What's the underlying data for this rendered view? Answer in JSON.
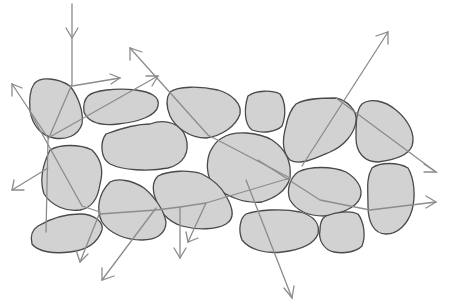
{
  "diagram": {
    "title": "",
    "colors": {
      "grain_fill": "#d2d2d2",
      "grain_stroke": "#4a4a4a",
      "ray": "#8c8c8c",
      "background": "#ffffff"
    },
    "grains": [
      {
        "id": "g1",
        "d": "M34,84 C40,76 58,78 70,86 C78,96 84,112 82,124 C78,136 66,140 54,138 C42,136 32,126 30,110 C29,98 30,90 34,84 Z"
      },
      {
        "id": "g2",
        "d": "M88,96 C94,90 116,88 136,90 C150,92 160,96 158,106 C156,116 138,122 118,124 C100,126 88,122 84,112 C83,104 85,99 88,96 Z"
      },
      {
        "id": "g3",
        "d": "M106,134 C122,128 140,124 150,124 C166,118 182,124 186,138 C190,152 184,164 168,168 C148,172 122,170 110,164 C100,158 100,142 106,134 Z"
      },
      {
        "id": "g4",
        "d": "M170,92 C178,86 200,86 218,90 C232,94 242,104 240,114 C236,126 222,136 206,138 C190,138 176,128 170,116 C166,106 166,98 170,92 Z"
      },
      {
        "id": "g5",
        "d": "M248,96 C256,90 272,90 280,94 C286,102 286,116 282,126 C276,132 262,134 252,130 C244,124 244,108 248,96 Z"
      },
      {
        "id": "g6",
        "d": "M296,104 C306,98 324,98 336,98 C346,100 358,110 356,122 C354,134 344,146 330,152 C316,158 300,166 290,160 C282,152 282,140 286,126 C288,116 292,108 296,104 Z"
      },
      {
        "id": "g7",
        "d": "M362,104 C370,98 384,100 396,110 C408,120 416,134 412,146 C408,156 394,160 378,162 C364,162 356,152 356,138 C356,124 356,110 362,104 Z"
      },
      {
        "id": "g8",
        "d": "M222,138 C234,130 258,132 272,140 C284,148 292,160 290,178 C286,192 274,198 262,202 C244,204 226,196 214,186 C206,176 206,162 210,152 C214,144 218,140 222,138 Z"
      },
      {
        "id": "g9",
        "d": "M50,150 C60,144 80,144 92,150 C100,158 104,170 100,184 C98,198 92,208 80,210 C66,212 52,206 44,194 C40,182 42,166 50,150 Z"
      },
      {
        "id": "g10",
        "d": "M158,176 C170,170 190,170 202,174 C214,180 222,188 226,196 C232,206 236,218 226,224 C216,230 196,230 182,226 C168,222 158,210 156,200 C152,190 152,182 158,176 Z"
      },
      {
        "id": "g11",
        "d": "M110,182 C118,178 132,180 144,188 C154,196 164,210 166,222 C166,234 156,240 142,240 C126,240 110,234 102,222 C96,210 98,194 110,182 Z"
      },
      {
        "id": "g12",
        "d": "M298,172 C310,166 332,166 346,172 C356,178 364,188 360,198 C356,208 340,214 324,216 C308,216 296,210 290,200 C286,190 290,178 298,172 Z"
      },
      {
        "id": "g13",
        "d": "M372,168 C380,162 398,162 408,168 C414,178 416,196 412,210 C408,224 398,234 386,234 C374,234 368,222 368,206 C368,190 366,178 372,168 Z"
      },
      {
        "id": "g14",
        "d": "M38,226 C48,220 64,214 80,214 C94,214 104,222 102,230 C98,242 88,250 70,252 C54,254 38,252 32,244 C30,236 32,230 38,226 Z"
      },
      {
        "id": "g15",
        "d": "M246,214 C258,210 282,208 300,212 C314,216 320,224 318,234 C314,244 300,250 282,252 C266,254 250,250 242,240 C238,230 240,218 246,214 Z"
      },
      {
        "id": "g16",
        "d": "M326,216 C336,212 350,210 358,214 C364,222 366,236 362,246 C356,252 344,254 334,252 C324,250 318,240 320,230 C320,222 322,218 326,216 Z"
      }
    ],
    "rays": [
      {
        "id": "r1",
        "points": "72,12 72,84 48,140 46,230",
        "head_at_start": false,
        "head_end": "72,36",
        "head_dir": "down"
      },
      {
        "id": "r2",
        "points": "72,84 120,78",
        "arrow": true
      },
      {
        "id": "r3",
        "points": "48,138 158,76",
        "arrow": true
      },
      {
        "id": "r4",
        "points": "12,84 48,138",
        "arrow_start": true
      },
      {
        "id": "r5",
        "points": "48,168 12,190",
        "arrow": true
      },
      {
        "id": "r6",
        "points": "30,112 82,206 100,214 80,260",
        "arrow": true
      },
      {
        "id": "r7",
        "points": "130,48 208,135 290,178",
        "arrow_start": true
      },
      {
        "id": "r8",
        "points": "100,214 156,210 180,207 206,203",
        "arrow": false
      },
      {
        "id": "r9",
        "points": "156,208 102,280",
        "arrow": true
      },
      {
        "id": "r10",
        "points": "180,207 180,258",
        "arrow": true
      },
      {
        "id": "r11",
        "points": "206,203 290,178",
        "arrow": false
      },
      {
        "id": "r12",
        "points": "206,203 188,240",
        "arrow": true
      },
      {
        "id": "r13",
        "points": "250,190 292,298",
        "arrow": true
      },
      {
        "id": "r14",
        "points": "302,166 388,32",
        "arrow": true
      },
      {
        "id": "r15",
        "points": "336,98 436,172",
        "arrow": true
      },
      {
        "id": "r16",
        "points": "258,160 320,200 370,210 436,202",
        "arrow": true
      }
    ]
  }
}
